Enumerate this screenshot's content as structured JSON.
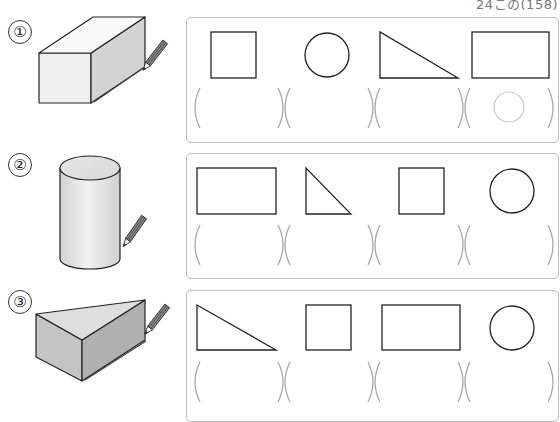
{
  "header": {
    "page_ref": "24この(158)"
  },
  "questions": [
    {
      "number": "①",
      "solid": "rectangular-prism",
      "shapes": [
        "square",
        "circle",
        "right-triangle",
        "rectangle"
      ],
      "answers": [
        "",
        "",
        "",
        "○"
      ]
    },
    {
      "number": "②",
      "solid": "cylinder",
      "shapes": [
        "rectangle",
        "right-triangle",
        "square",
        "circle"
      ],
      "answers": [
        "",
        "",
        "",
        ""
      ]
    },
    {
      "number": "③",
      "solid": "triangular-prism",
      "shapes": [
        "right-triangle",
        "square",
        "rectangle",
        "circle"
      ],
      "answers": [
        "",
        "",
        "",
        ""
      ]
    }
  ],
  "colors": {
    "line": "#222222",
    "bracket": "#a8a8a8",
    "panel_border": "#bbbbbb",
    "example_mark": "#c8c8c8",
    "solid_light": "#efefef",
    "solid_mid": "#d6d6d6",
    "solid_dark": "#b8b8b8"
  }
}
